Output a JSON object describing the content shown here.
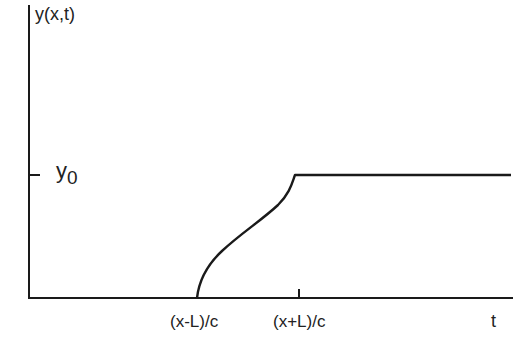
{
  "diagram": {
    "y_axis_label": "y(x,t)",
    "x_axis_label": "t",
    "y_level_label": {
      "main": "y",
      "subscript": "0"
    },
    "x_ticks": [
      {
        "label": "(x-L)/c"
      },
      {
        "label": "(x+L)/c"
      }
    ],
    "line_color": "#1a1a1a"
  }
}
